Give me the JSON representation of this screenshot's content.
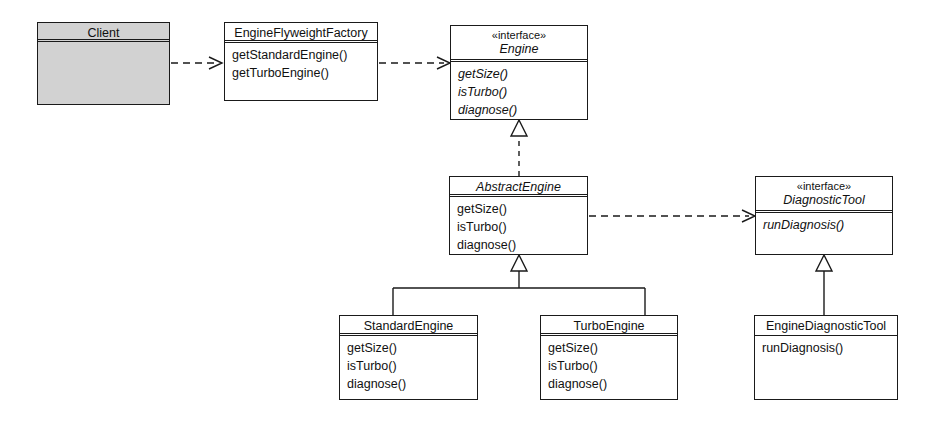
{
  "diagram": {
    "width": 930,
    "height": 424,
    "colors": {
      "line": "#1a1a1a",
      "background": "#ffffff",
      "filled_node": "#d2d2d2"
    }
  },
  "classes": [
    {
      "id": "client",
      "name": "Client",
      "stereotype": "",
      "abstract": false,
      "filled": true,
      "header_rule": "double",
      "members": [],
      "x": 37,
      "y": 22,
      "width": 133,
      "height": 83,
      "header_height": 19
    },
    {
      "id": "engine-flyweight-factory",
      "name": "EngineFlyweightFactory",
      "stereotype": "",
      "abstract": false,
      "filled": false,
      "header_rule": "double",
      "members": [
        "getStandardEngine()",
        "getTurboEngine()"
      ],
      "x": 224,
      "y": 22,
      "width": 154,
      "height": 79,
      "header_height": 20
    },
    {
      "id": "engine",
      "name": "Engine",
      "stereotype": "«interface»",
      "abstract": true,
      "filled": false,
      "header_rule": "double",
      "members": [
        "getSize()",
        "isTurbo()",
        "diagnose()"
      ],
      "x": 450,
      "y": 25,
      "width": 138,
      "height": 95,
      "header_height": 36
    },
    {
      "id": "abstract-engine",
      "name": "AbstractEngine",
      "stereotype": "",
      "abstract": true,
      "filled": false,
      "header_rule": "double",
      "members": [
        "getSize()",
        "isTurbo()",
        "diagnose()"
      ],
      "x": 449,
      "y": 176,
      "width": 139,
      "height": 79,
      "header_height": 20
    },
    {
      "id": "diagnostic-tool",
      "name": "DiagnosticTool",
      "stereotype": "«interface»",
      "abstract": true,
      "filled": false,
      "header_rule": "double",
      "members": [
        "runDiagnosis()"
      ],
      "x": 755,
      "y": 176,
      "width": 138,
      "height": 79,
      "header_height": 36
    },
    {
      "id": "standard-engine",
      "name": "StandardEngine",
      "stereotype": "",
      "abstract": false,
      "filled": false,
      "header_rule": "double",
      "members": [
        "getSize()",
        "isTurbo()",
        "diagnose()"
      ],
      "x": 339,
      "y": 315,
      "width": 139,
      "height": 85,
      "header_height": 20
    },
    {
      "id": "turbo-engine",
      "name": "TurboEngine",
      "stereotype": "",
      "abstract": false,
      "filled": false,
      "header_rule": "double",
      "members": [
        "getSize()",
        "isTurbo()",
        "diagnose()"
      ],
      "x": 540,
      "y": 315,
      "width": 138,
      "height": 85,
      "header_height": 20
    },
    {
      "id": "engine-diagnostic-tool",
      "name": "EngineDiagnosticTool",
      "stereotype": "",
      "abstract": false,
      "filled": false,
      "header_rule": "single",
      "members": [
        "runDiagnosis()"
      ],
      "x": 754,
      "y": 315,
      "width": 144,
      "height": 85,
      "header_height": 20
    }
  ],
  "relationships": [
    {
      "id": "client-to-factory",
      "type": "dependency",
      "style": "dashed",
      "arrow": "open",
      "from": "client",
      "to": "engine-flyweight-factory"
    },
    {
      "id": "factory-to-engine",
      "type": "dependency",
      "style": "dashed",
      "arrow": "open",
      "from": "engine-flyweight-factory",
      "to": "engine"
    },
    {
      "id": "abstractengine-realizes-engine",
      "type": "realization",
      "style": "dashed",
      "arrow": "hollow-triangle",
      "from": "abstract-engine",
      "to": "engine"
    },
    {
      "id": "abstractengine-to-diagnostictool",
      "type": "dependency",
      "style": "dashed",
      "arrow": "open",
      "from": "abstract-engine",
      "to": "diagnostic-tool"
    },
    {
      "id": "standardengine-extends-abstractengine",
      "type": "generalization",
      "style": "solid",
      "arrow": "hollow-triangle",
      "from": "standard-engine",
      "to": "abstract-engine"
    },
    {
      "id": "turboengine-extends-abstractengine",
      "type": "generalization",
      "style": "solid",
      "arrow": "hollow-triangle",
      "from": "turbo-engine",
      "to": "abstract-engine"
    },
    {
      "id": "enginediagnostictool-realizes-diagnostictool",
      "type": "realization",
      "style": "solid",
      "arrow": "hollow-triangle",
      "from": "engine-diagnostic-tool",
      "to": "diagnostic-tool"
    }
  ]
}
